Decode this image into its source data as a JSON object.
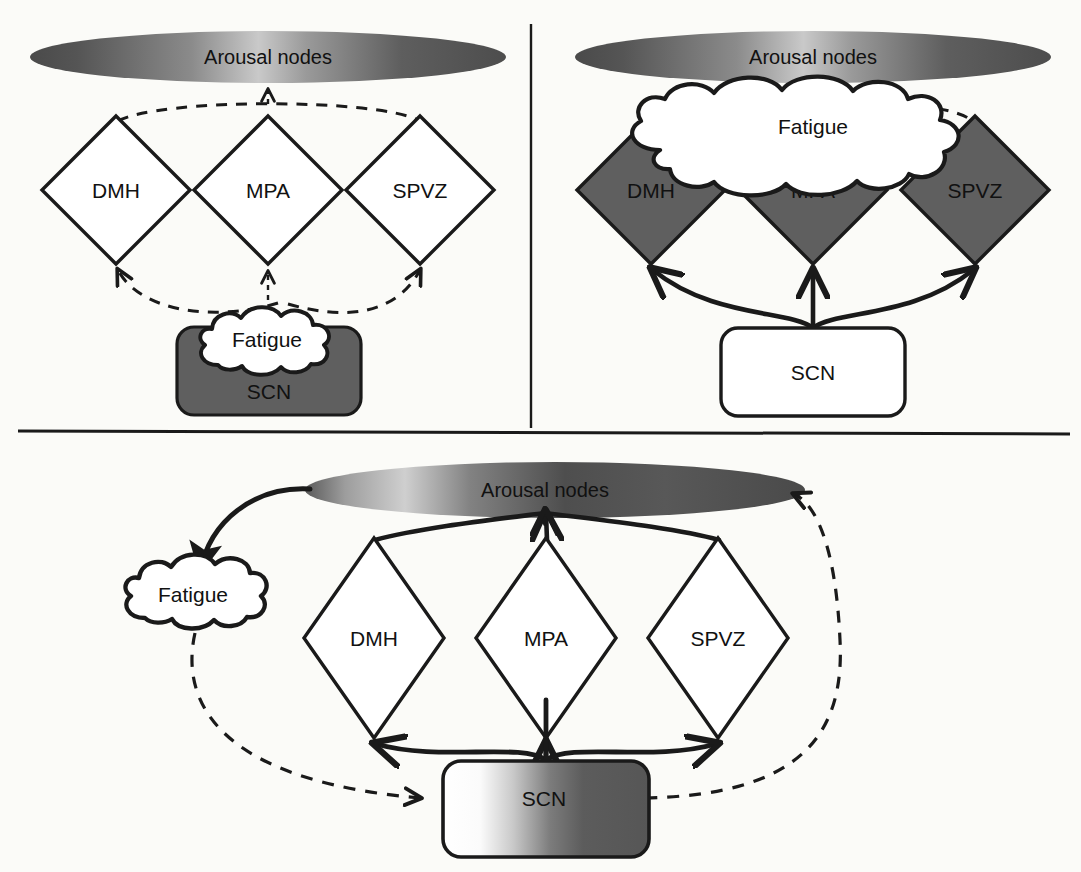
{
  "figure": {
    "type": "diagram",
    "colors": {
      "stroke": "#1a1a1a",
      "fill_gray": "#5f5f5f",
      "fill_white": "#ffffff",
      "background": "#fbfbf8",
      "ellipse_dark": "#4a4a4a",
      "ellipse_light": "#bdbdbd"
    },
    "panels": [
      {
        "id": "panel-a",
        "position": "top-left",
        "arousal_label": "Arousal nodes",
        "nodes": [
          "DMH",
          "MPA",
          "SPVZ"
        ],
        "node_style": "white-filled diamond",
        "scn_label": "SCN",
        "scn_style": "gray-filled rounded rectangle",
        "fatigue_label": "Fatigue",
        "fatigue_style": "white cloud overlapping SCN",
        "connection_style": "dashed"
      },
      {
        "id": "panel-b",
        "position": "top-right",
        "arousal_label": "Arousal nodes",
        "nodes": [
          "DMH",
          "MPA",
          "SPVZ"
        ],
        "node_style": "gray-filled diamond",
        "scn_label": "SCN",
        "scn_style": "white rounded rectangle",
        "fatigue_label": "Fatigue",
        "fatigue_style": "large white cloud over node tops",
        "connection_style": "solid-to-nodes, dashed-to-arousal"
      },
      {
        "id": "panel-c",
        "position": "bottom",
        "arousal_label": "Arousal nodes",
        "nodes": [
          "DMH",
          "MPA",
          "SPVZ"
        ],
        "node_style": "white-filled diamond",
        "scn_label": "SCN",
        "scn_style": "gradient white-to-gray rounded rectangle",
        "fatigue_label": "Fatigue",
        "fatigue_style": "white cloud at left",
        "connection_style": "solid arousal-to-fatigue, dashed fatigue-to-SCN, dashed SCN-to-arousal"
      }
    ],
    "labels": {
      "arousal_nodes": "Arousal nodes",
      "dmh": "DMH",
      "mpa": "MPA",
      "spvz": "SPVZ",
      "scn": "SCN",
      "fatigue": "Fatigue"
    }
  }
}
